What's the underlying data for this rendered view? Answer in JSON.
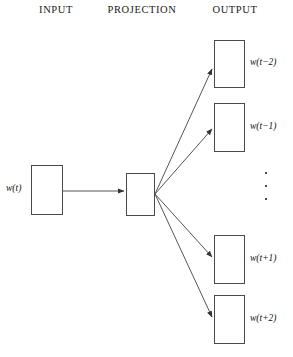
{
  "diagram": {
    "background_color": "#ffffff",
    "line_color": "#4a4a4a",
    "text_color": "#111111"
  },
  "headers": {
    "input": "INPUT",
    "projection": "PROJECTION",
    "output": "OUTPUT"
  },
  "input_layer": {
    "label_prefix": "w(",
    "label_var": "t",
    "label_suffix": ")",
    "label_full": "w(t)"
  },
  "projection_layer": {
    "label": ""
  },
  "output_layer": {
    "ellipsis": "⋮",
    "nodes": [
      {
        "label_prefix": "w(",
        "label_var": "t",
        "label_suffix": "−2)",
        "label_full": "w(t−2)"
      },
      {
        "label_prefix": "w(",
        "label_var": "t",
        "label_suffix": "−1)",
        "label_full": "w(t−1)"
      },
      {
        "label_prefix": "w(",
        "label_var": "t",
        "label_suffix": "+1)",
        "label_full": "w(t+1)"
      },
      {
        "label_prefix": "w(",
        "label_var": "t",
        "label_suffix": "+2)",
        "label_full": "w(t+2)"
      }
    ]
  }
}
